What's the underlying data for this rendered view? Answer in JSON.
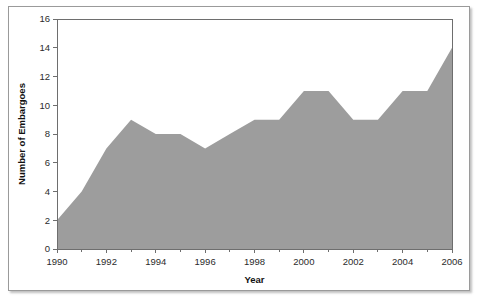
{
  "chart_data": {
    "type": "area",
    "title": "",
    "xlabel": "Year",
    "ylabel": "Number of Embargoes",
    "x": [
      1990,
      1991,
      1992,
      1993,
      1994,
      1995,
      1996,
      1997,
      1998,
      1999,
      2000,
      2001,
      2002,
      2003,
      2004,
      2005,
      2006
    ],
    "values": [
      2,
      4,
      7,
      9,
      8,
      8,
      7,
      8,
      9,
      9,
      11,
      11,
      9,
      9,
      11,
      11,
      14
    ],
    "series": [
      {
        "name": "Number of Embargoes",
        "values": [
          2,
          4,
          7,
          9,
          8,
          8,
          7,
          8,
          9,
          9,
          11,
          11,
          9,
          9,
          11,
          11,
          14
        ]
      }
    ],
    "xlim": [
      1990,
      2006
    ],
    "ylim": [
      0,
      16
    ],
    "yticks": [
      0,
      2,
      4,
      6,
      8,
      10,
      12,
      14,
      16
    ],
    "ytick_labels": [
      "0",
      "2",
      "4",
      "6",
      "8",
      "10",
      "12",
      "14",
      "16"
    ],
    "xticks": [
      1990,
      1992,
      1994,
      1996,
      1998,
      2000,
      2002,
      2004,
      2006
    ],
    "xtick_labels": [
      "1990",
      "1992",
      "1994",
      "1996",
      "1998",
      "2000",
      "2002",
      "2004",
      "2006"
    ],
    "x_minor_ticks": [
      1991,
      1993,
      1995,
      1997,
      1999,
      2001,
      2003,
      2005
    ],
    "grid": false,
    "legend": null,
    "fill_color": "#9d9d9d",
    "axis_color": "#6e6e6e",
    "text_color": "#2b2b2b"
  }
}
